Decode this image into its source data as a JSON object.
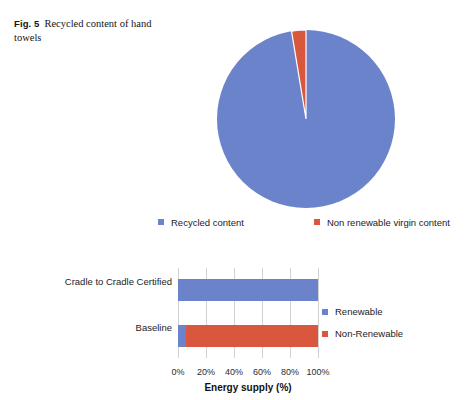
{
  "caption": {
    "fig_label": "Fig. 5",
    "text": "Recycled content of hand towels"
  },
  "colors": {
    "blue": "#6b83cb",
    "red": "#d9573c",
    "gridline": "#d2d2d2",
    "text": "#1c1c1c"
  },
  "pie_legend": {
    "items": [
      {
        "label": "Recycled content",
        "color": "#6b83cb",
        "marker": "square-swatch"
      },
      {
        "label": "Non renewable virgin content",
        "color": "#d9573c",
        "marker": "square-swatch"
      }
    ]
  },
  "bar_legend": {
    "items": [
      {
        "label": "Renewable",
        "color": "#6b83cb",
        "marker": "square-swatch"
      },
      {
        "label": "Non-Renewable",
        "color": "#d9573c",
        "marker": "square-swatch"
      }
    ]
  },
  "chart_data": [
    {
      "type": "pie",
      "title": "",
      "labels": [
        "Recycled content",
        "Non renewable virgin content"
      ],
      "values": [
        97.4,
        2.6
      ],
      "unit": "%",
      "colors": [
        "#6b83cb",
        "#d9573c"
      ],
      "start_angle_deg": -90,
      "legend_position": "bottom",
      "grid": false,
      "annotations": []
    },
    {
      "type": "bar",
      "orientation": "horizontal",
      "stacked": true,
      "title": "",
      "categories": [
        "Cradle to Cradle Certified",
        "Baseline"
      ],
      "series": [
        {
          "name": "Renewable",
          "values": [
            100,
            6
          ],
          "color": "#6b83cb"
        },
        {
          "name": "Non-Renewable",
          "values": [
            0,
            94
          ],
          "color": "#d9573c"
        }
      ],
      "xlabel": "Energy supply (%)",
      "ylabel": "",
      "xlim": [
        0,
        100
      ],
      "xticks": [
        0,
        20,
        40,
        60,
        80,
        100
      ],
      "xticklabels": [
        "0%",
        "20%",
        "40%",
        "60%",
        "80%",
        "100%"
      ],
      "grid": true,
      "grid_axis": "x",
      "legend_position": "right"
    }
  ]
}
